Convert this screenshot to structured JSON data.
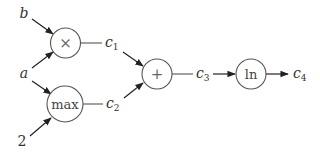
{
  "diagram": {
    "type": "computation-graph",
    "inputs": [
      {
        "id": "b",
        "label": "b"
      },
      {
        "id": "a",
        "label": "a"
      },
      {
        "id": "two",
        "label": "2"
      }
    ],
    "nodes": [
      {
        "id": "mul",
        "label": "×"
      },
      {
        "id": "max",
        "label": "max"
      },
      {
        "id": "add",
        "label": "+"
      },
      {
        "id": "ln",
        "label": "ln"
      }
    ],
    "intermediates": [
      {
        "id": "c1",
        "base": "c",
        "sub": "1"
      },
      {
        "id": "c2",
        "base": "c",
        "sub": "2"
      },
      {
        "id": "c3",
        "base": "c",
        "sub": "3"
      },
      {
        "id": "c4",
        "base": "c",
        "sub": "4"
      }
    ],
    "edges": [
      {
        "from": "b",
        "to": "mul"
      },
      {
        "from": "a",
        "to": "mul"
      },
      {
        "from": "a",
        "to": "max"
      },
      {
        "from": "two",
        "to": "max"
      },
      {
        "from": "mul",
        "to": "c1"
      },
      {
        "from": "max",
        "to": "c2"
      },
      {
        "from": "c1",
        "to": "add"
      },
      {
        "from": "c2",
        "to": "add"
      },
      {
        "from": "add",
        "to": "c3"
      },
      {
        "from": "c3",
        "to": "ln"
      },
      {
        "from": "ln",
        "to": "c4"
      }
    ],
    "colors": {
      "stroke": "#555555",
      "arrow": "#222222",
      "text": "#333333",
      "background": "#ffffff"
    }
  }
}
